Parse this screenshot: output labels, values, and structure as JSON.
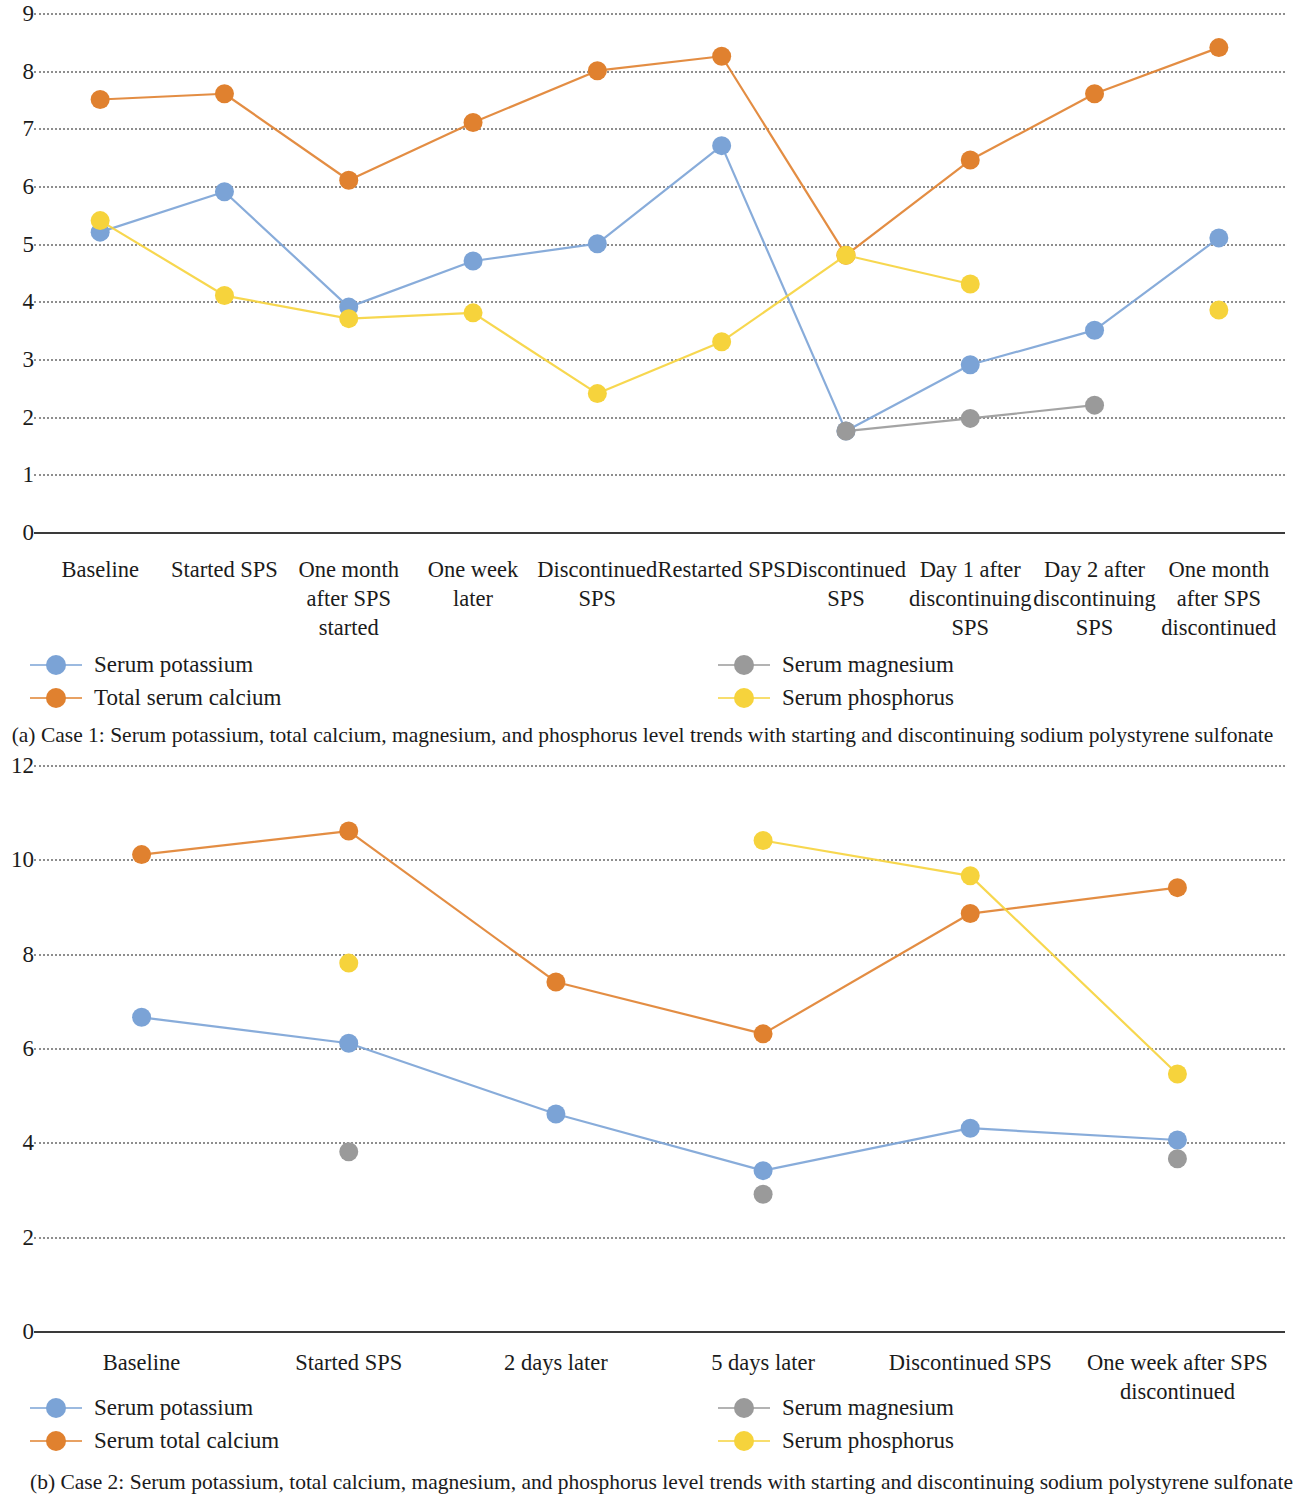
{
  "chart_data": [
    {
      "type": "line",
      "panel": "a",
      "title": "",
      "caption": "(a) Case 1: Serum potassium, total calcium, magnesium, and phosphorus level trends with starting and discontinuing sodium polystyrene sulfonate",
      "xlabel": "",
      "ylabel": "",
      "ylim": [
        0,
        9
      ],
      "yticks": [
        0,
        1,
        2,
        3,
        4,
        5,
        6,
        7,
        8,
        9
      ],
      "grid": true,
      "legend_position": "below-plot",
      "categories": [
        "Baseline",
        "Started SPS",
        "One month\nafter SPS\nstarted",
        "One week\nlater",
        "Discontinued\nSPS",
        "Restarted SPS",
        "Discontinued\nSPS",
        "Day 1 after\ndiscontinuing\nSPS",
        "Day 2 after\ndiscontinuing\nSPS",
        "One month\nafter SPS\ndiscontinued"
      ],
      "series": [
        {
          "name": "Serum potassium",
          "color": "#7ba3d6",
          "values": [
            5.2,
            5.9,
            3.9,
            4.7,
            5.0,
            6.7,
            1.75,
            2.9,
            3.5,
            5.1
          ]
        },
        {
          "name": "Total serum calcium",
          "color": "#e0812f",
          "values": [
            7.5,
            7.6,
            6.1,
            7.1,
            8.0,
            8.25,
            4.8,
            6.45,
            7.6,
            8.4
          ]
        },
        {
          "name": "Serum magnesium",
          "color": "#9a9a9a",
          "values": [
            null,
            null,
            null,
            null,
            null,
            null,
            1.75,
            1.97,
            2.2,
            null
          ]
        },
        {
          "name": "Serum phosphorus",
          "color": "#f6d33c",
          "values": [
            5.4,
            4.1,
            3.7,
            3.8,
            2.4,
            3.3,
            4.8,
            4.3,
            null,
            3.85
          ]
        }
      ]
    },
    {
      "type": "line",
      "panel": "b",
      "title": "",
      "caption": "(b) Case 2: Serum potassium, total calcium, magnesium, and phosphorus level trends with starting and discontinuing sodium polystyrene sulfonate",
      "xlabel": "",
      "ylabel": "",
      "ylim": [
        0,
        12
      ],
      "yticks": [
        0,
        2,
        4,
        6,
        8,
        10,
        12
      ],
      "grid": true,
      "legend_position": "below-plot",
      "categories": [
        "Baseline",
        "Started SPS",
        "2 days later",
        "5 days later",
        "Discontinued SPS",
        "One week after SPS\ndiscontinued"
      ],
      "series": [
        {
          "name": "Serum potassium",
          "color": "#7ba3d6",
          "values": [
            6.65,
            6.1,
            4.6,
            3.4,
            4.3,
            4.05
          ]
        },
        {
          "name": "Serum total calcium",
          "color": "#e0812f",
          "values": [
            10.1,
            10.6,
            7.4,
            6.3,
            8.85,
            9.4
          ]
        },
        {
          "name": "Serum magnesium",
          "color": "#9a9a9a",
          "values": [
            null,
            3.8,
            null,
            2.9,
            null,
            3.65
          ]
        },
        {
          "name": "Serum phosphorus",
          "color": "#f6d33c",
          "values": [
            null,
            7.8,
            null,
            10.4,
            9.65,
            5.45
          ]
        }
      ]
    }
  ],
  "chart_a": {
    "yticks": [
      "9",
      "8",
      "7",
      "6",
      "5",
      "4",
      "3",
      "2",
      "1",
      "0"
    ],
    "categories": [
      "Baseline",
      "Started SPS",
      "One month\nafter SPS\nstarted",
      "One week\nlater",
      "Discontinued\nSPS",
      "Restarted SPS",
      "Discontinued\nSPS",
      "Day 1 after\ndiscontinuing\nSPS",
      "Day 2 after\ndiscontinuing\nSPS",
      "One month\nafter SPS\ndiscontinued"
    ],
    "legend": [
      "Serum potassium",
      "Total serum calcium",
      "Serum magnesium",
      "Serum phosphorus"
    ],
    "caption": "(a) Case 1: Serum potassium, total calcium, magnesium, and phosphorus level trends with starting and discontinuing sodium polystyrene sulfonate"
  },
  "chart_b": {
    "yticks": [
      "12",
      "10",
      "8",
      "6",
      "4",
      "2",
      "0"
    ],
    "categories": [
      "Baseline",
      "Started SPS",
      "2 days later",
      "5 days later",
      "Discontinued SPS",
      "One week after SPS\ndiscontinued"
    ],
    "legend": [
      "Serum potassium",
      "Serum total calcium",
      "Serum magnesium",
      "Serum phosphorus"
    ],
    "caption": "(b) Case 2: Serum potassium, total calcium, magnesium, and phosphorus level trends with starting and discontinuing sodium polystyrene sulfonate"
  },
  "colors": {
    "potassium": "#7ba3d6",
    "calcium": "#e0812f",
    "magnesium": "#9a9a9a",
    "phosphorus": "#f6d33c",
    "grid": "#7b7b7b",
    "axis": "#3a3a3a",
    "text": "#1b1b1b"
  }
}
